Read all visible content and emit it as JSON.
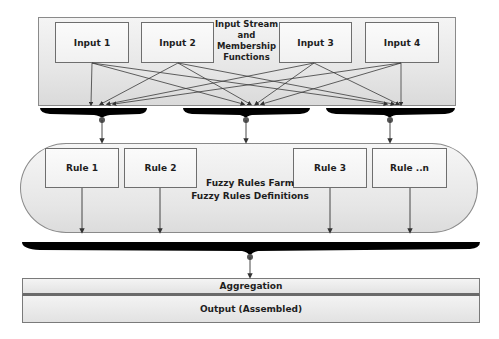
{
  "top_caption_partial": "",
  "input_section": {
    "title_lines": [
      "Input Stream",
      "and",
      "Membership",
      "Functions"
    ],
    "inputs": [
      {
        "label": "Input 1"
      },
      {
        "label": "Input 2"
      },
      {
        "label": "Input 3"
      },
      {
        "label": "Input 4"
      }
    ]
  },
  "rules_section": {
    "title_lines": [
      "Fuzzy Rules Farm",
      "Fuzzy Rules Definitions"
    ],
    "rules": [
      {
        "label": "Rule 1"
      },
      {
        "label": "Rule 2"
      },
      {
        "label": "Rule 3"
      },
      {
        "label": "Rule ..n"
      }
    ]
  },
  "aggregation": {
    "label": "Aggregation"
  },
  "output": {
    "label": "Output (Assembled)"
  },
  "colors": {
    "bar": "#000000",
    "line": "#333333",
    "border": "#8a8a8a",
    "fill_light": "#f4f4f4",
    "fill_dark": "#dcdcdc"
  }
}
